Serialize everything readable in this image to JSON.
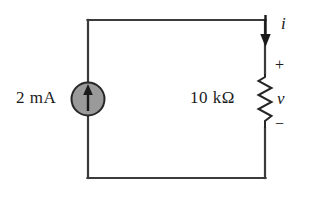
{
  "diagram": {
    "kind": "electrical-circuit-schematic",
    "background_color": "#ffffff",
    "wire_color": "#3b3b3b",
    "ink_color": "#1a1a1a"
  },
  "components": {
    "current_source": {
      "label": "2 mA",
      "symbol": "current-source-circle-with-up-arrow",
      "arrow_direction": "up",
      "fill_color": "#9a9a9a",
      "outline_color": "#262626"
    },
    "resistor": {
      "label": "10 kΩ",
      "symbol": "resistor-zigzag-vertical",
      "stroke_color": "#262626"
    }
  },
  "annotations": {
    "current": {
      "symbol": "i",
      "arrow_direction": "down",
      "arrow_name": "current-direction-arrow"
    },
    "voltage": {
      "symbol": "v",
      "polarity_plus": "+",
      "polarity_minus": "−"
    }
  }
}
